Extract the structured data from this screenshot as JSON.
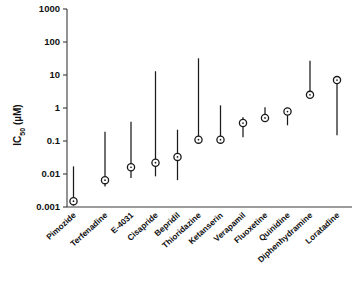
{
  "chart_data": {
    "type": "scatter",
    "title": "",
    "xlabel": "",
    "ylabel": "IC50 (µM)",
    "ylabel_base": "IC",
    "ylabel_sub": "50",
    "ylabel_unit": " (µM)",
    "yscale": "log",
    "ylim": [
      0.001,
      1000
    ],
    "ytick_labels": [
      "1000",
      "100",
      "10",
      "1",
      "0.1",
      "0.01",
      "0.001"
    ],
    "ytick_values": [
      1000,
      100,
      10,
      1,
      0.1,
      0.01,
      0.001
    ],
    "grid": false,
    "legend": "none",
    "marker_style": "open-circle-with-center-dot",
    "error_bar_style": "vertical-range-line",
    "categories": [
      "Pimozide",
      "Terfenadine",
      "E-4031",
      "Cisapride",
      "Bepridil",
      "Thioridazine",
      "Ketanserin",
      "Verapamil",
      "Fluoxetine",
      "Quinidine",
      "Diphenhydramine",
      "Loratadine"
    ],
    "values": [
      0.0015,
      0.0065,
      0.016,
      0.022,
      0.033,
      0.11,
      0.11,
      0.35,
      0.5,
      0.78,
      2.5,
      7.0
    ],
    "range_low": [
      0.0011,
      0.0042,
      0.0075,
      0.0085,
      0.0065,
      0.1,
      0.1,
      0.13,
      0.4,
      0.3,
      2.1,
      0.15
    ],
    "range_high": [
      0.017,
      0.19,
      0.38,
      13.0,
      0.22,
      32.0,
      1.2,
      0.52,
      1.05,
      0.9,
      27.0,
      7.6
    ],
    "points": [
      {
        "label": "Pimozide",
        "value": 0.0015,
        "low": 0.0011,
        "high": 0.017
      },
      {
        "label": "Terfenadine",
        "value": 0.0065,
        "low": 0.0042,
        "high": 0.19
      },
      {
        "label": "E-4031",
        "value": 0.016,
        "low": 0.0075,
        "high": 0.38
      },
      {
        "label": "Cisapride",
        "value": 0.022,
        "low": 0.0085,
        "high": 13.0
      },
      {
        "label": "Bepridil",
        "value": 0.033,
        "low": 0.0065,
        "high": 0.22
      },
      {
        "label": "Thioridazine",
        "value": 0.11,
        "low": 0.1,
        "high": 32.0
      },
      {
        "label": "Ketanserin",
        "value": 0.11,
        "low": 0.1,
        "high": 1.2
      },
      {
        "label": "Verapamil",
        "value": 0.35,
        "low": 0.13,
        "high": 0.52
      },
      {
        "label": "Fluoxetine",
        "value": 0.5,
        "low": 0.4,
        "high": 1.05
      },
      {
        "label": "Quinidine",
        "value": 0.78,
        "low": 0.3,
        "high": 0.9
      },
      {
        "label": "Diphenhydramine",
        "value": 2.5,
        "low": 2.1,
        "high": 27.0
      },
      {
        "label": "Loratadine",
        "value": 7.0,
        "low": 0.15,
        "high": 7.6
      }
    ]
  }
}
